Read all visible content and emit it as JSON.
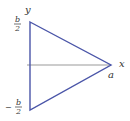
{
  "diagram": {
    "type": "triangle-on-axes",
    "colors": {
      "triangle": "#4a55a8",
      "axis": "#999999",
      "text": "#333333"
    },
    "labels": {
      "y_axis": "y",
      "x_axis": "x",
      "apex": "a",
      "top_numerator": "b",
      "top_denominator": "2",
      "bottom_sign": "−",
      "bottom_numerator": "b",
      "bottom_denominator": "2"
    }
  }
}
